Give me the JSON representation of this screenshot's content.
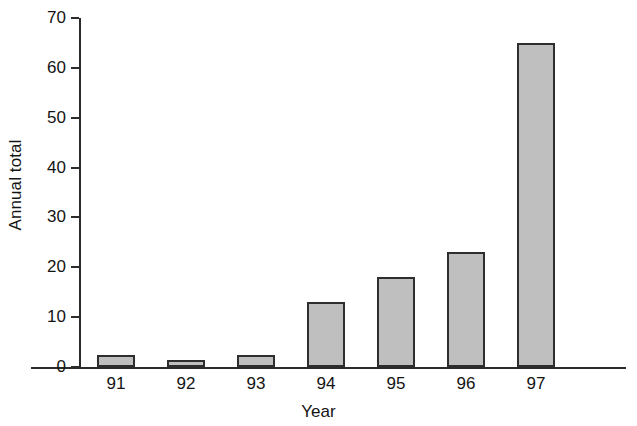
{
  "chart_data": {
    "type": "bar",
    "title": "",
    "xlabel": "Year",
    "ylabel": "Annual total",
    "categories": [
      "91",
      "92",
      "93",
      "94",
      "95",
      "96",
      "97"
    ],
    "values": [
      2.5,
      1.5,
      2.5,
      13,
      18,
      23,
      65
    ],
    "ylim": [
      0,
      70
    ],
    "yticks": [
      0,
      10,
      20,
      30,
      40,
      50,
      60,
      70
    ],
    "ytick_labels": [
      "0",
      "10",
      "20",
      "30",
      "40",
      "50",
      "60",
      "70"
    ],
    "grid": false,
    "legend": null,
    "legend_position": "none",
    "bar_fill_color": "#bfbfbf",
    "bar_edge_color": "#2e2e2e",
    "axis_color": "#2b2b2b",
    "background_color": "#ffffff"
  }
}
